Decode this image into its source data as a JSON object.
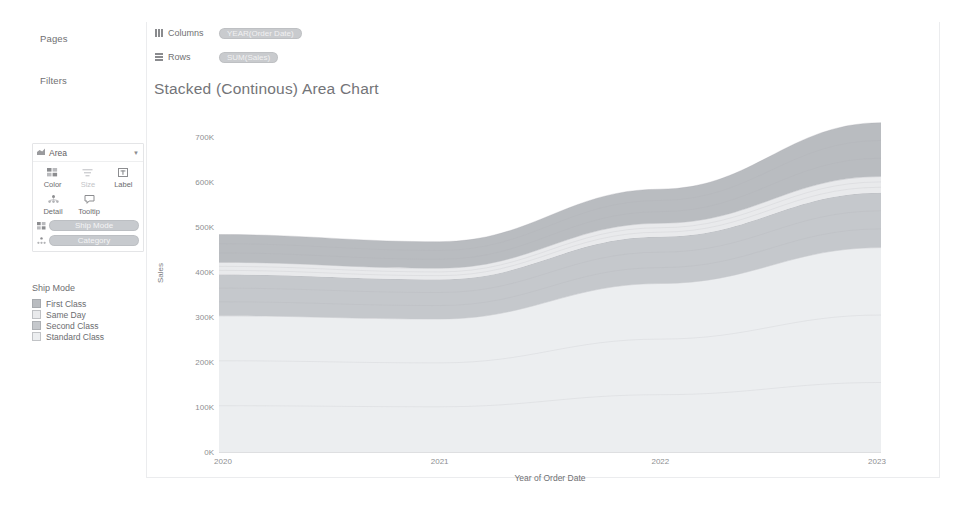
{
  "sidebar": {
    "pages_label": "Pages",
    "filters_label": "Filters",
    "marks_label": "Marks",
    "marks_card": {
      "mark_type": "Area",
      "mark_type_icon": "area-mark-icon",
      "caret_icon": "chevron-down-icon",
      "buttons": [
        {
          "label": "Color",
          "icon": "color-icon",
          "enabled": true
        },
        {
          "label": "Size",
          "icon": "size-icon",
          "enabled": false
        },
        {
          "label": "Label",
          "icon": "label-icon",
          "enabled": true
        },
        {
          "label": "Detail",
          "icon": "detail-icon",
          "enabled": true
        },
        {
          "label": "Tooltip",
          "icon": "tooltip-icon",
          "enabled": true
        }
      ],
      "pills": [
        {
          "label": "Ship Mode",
          "icon": "color-icon"
        },
        {
          "label": "Category",
          "icon": "detail-icon"
        }
      ]
    },
    "legend": {
      "title": "Ship Mode",
      "items": [
        {
          "label": "First Class",
          "color": "#b9bcc0"
        },
        {
          "label": "Same Day",
          "color": "#e9eaec"
        },
        {
          "label": "Second Class",
          "color": "#c5c8cc"
        },
        {
          "label": "Standard Class",
          "color": "#eceef0"
        }
      ]
    }
  },
  "shelves": [
    {
      "name": "Columns",
      "icon": "columns-shelf-icon",
      "pill": "YEAR(Order Date)"
    },
    {
      "name": "Rows",
      "icon": "rows-shelf-icon",
      "pill": "SUM(Sales)"
    }
  ],
  "chart_data": {
    "type": "area",
    "title": "Stacked (Continous) Area Chart",
    "xlabel": "Year of Order Date",
    "ylabel": "Sales",
    "x": [
      2020,
      2021,
      2022,
      2023
    ],
    "xticklabels": [
      "2020",
      "2021",
      "2022",
      "2023"
    ],
    "ylim": [
      0,
      750000
    ],
    "yticks": [
      0,
      100000,
      200000,
      300000,
      400000,
      500000,
      600000,
      700000
    ],
    "yticklabels": [
      "0K",
      "100K",
      "200K",
      "300K",
      "400K",
      "500K",
      "600K",
      "700K"
    ],
    "grid": false,
    "stacked": true,
    "legend_position": "left",
    "series": [
      {
        "name": "Standard Class",
        "color": "#eceef0",
        "values": [
          303000,
          296000,
          375000,
          455000
        ]
      },
      {
        "name": "Second Class",
        "color": "#c5c8cc",
        "values": [
          92000,
          88000,
          104000,
          122000
        ]
      },
      {
        "name": "Same Day",
        "color": "#e9eaec",
        "values": [
          27000,
          25000,
          30000,
          36000
        ]
      },
      {
        "name": "First Class",
        "color": "#b9bcc0",
        "values": [
          62000,
          59000,
          76000,
          120000
        ]
      }
    ],
    "totals": [
      484000,
      468000,
      585000,
      733000
    ]
  }
}
